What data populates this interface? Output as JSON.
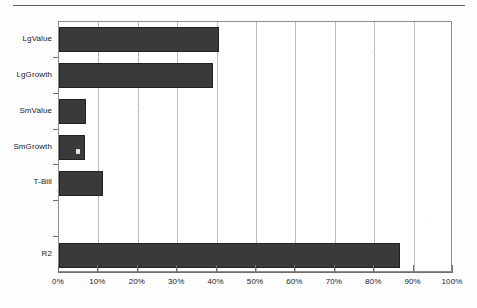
{
  "chart_data": {
    "type": "bar",
    "orientation": "horizontal",
    "title": "",
    "subtitle": "",
    "xlabel": "",
    "ylabel": "",
    "categories": [
      "LgValue",
      "LgGrowth",
      "SmValue",
      "SmGrowth",
      "T-Bill",
      "",
      "R2"
    ],
    "values": [
      40.5,
      39.0,
      6.9,
      6.6,
      11.2,
      null,
      86.5
    ],
    "value_unit": "%",
    "xlim": [
      0,
      100
    ],
    "xticks": [
      0,
      10,
      20,
      30,
      40,
      50,
      60,
      70,
      80,
      90,
      100
    ],
    "xtick_labels": [
      "0%",
      "10%",
      "20%",
      "30%",
      "40%",
      "50%",
      "60%",
      "70%",
      "80%",
      "90%",
      "100%"
    ],
    "grid": true,
    "grid_axis": "x",
    "legend": null,
    "series": [
      {
        "name": "",
        "color": "#3a3a3a",
        "values": [
          40.5,
          39.0,
          6.9,
          6.6,
          11.2,
          null,
          86.5
        ]
      }
    ]
  },
  "colors": {
    "bar_fill": "#3a3a3a",
    "bar_edge": "#222222",
    "gridline": "#b9b9b9",
    "axis": "#6f6f6f",
    "frame": "#8d8d8d",
    "text": "#1c1c1c",
    "background": "#fdfdfd"
  },
  "axis": {
    "category_labels": [
      "LgValue",
      "LgGrowth",
      "SmValue",
      "SmGrowth",
      "T-Bill",
      "",
      "R2"
    ],
    "x_labels": [
      "0%",
      "10%",
      "20%",
      "30%",
      "40%",
      "50%",
      "60%",
      "70%",
      "80%",
      "90%",
      "100%"
    ]
  }
}
